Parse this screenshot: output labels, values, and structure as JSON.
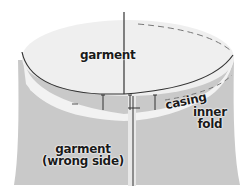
{
  "diagram": {
    "type": "sewing illustration - casing on garment",
    "labels": {
      "garment_top": "garment",
      "casing": "casing",
      "inner_fold_line1": "inner",
      "inner_fold_line2": "fold",
      "wrong_side_line1": "garment",
      "wrong_side_line2": "(wrong side)"
    },
    "colors": {
      "top_surface": "#eeeeee",
      "band": "#f2f2f2",
      "garment_body": "#c9c9c9",
      "lines": "#333333",
      "background": "#ffffff"
    }
  }
}
